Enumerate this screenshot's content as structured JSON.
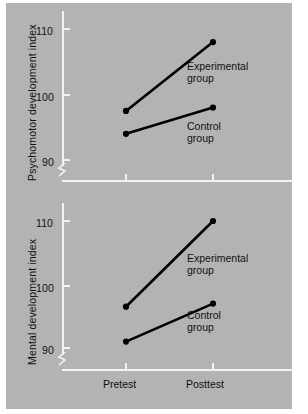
{
  "figure": {
    "background_color": "#b3b3b3",
    "axis_color": "#f2f2f2",
    "line_color": "#000000"
  },
  "chart_data": [
    {
      "type": "line",
      "title": "",
      "panel": "top",
      "xlabel": "",
      "ylabel": "Psychomotor development index",
      "categories": [
        "Pretest",
        "Posttest"
      ],
      "yticks": [
        90,
        100,
        110
      ],
      "ylim": [
        88,
        112
      ],
      "axis_break": true,
      "grid": false,
      "legend": "annotations-inline",
      "series": [
        {
          "name": "Experimental group",
          "values": [
            97.5,
            108.0
          ]
        },
        {
          "name": "Control group",
          "values": [
            94.0,
            98.0
          ]
        }
      ],
      "annotations": [
        {
          "text_line1": "Experimental",
          "text_line2": "group"
        },
        {
          "text_line1": "Control",
          "text_line2": "group"
        }
      ]
    },
    {
      "type": "line",
      "title": "",
      "panel": "bottom",
      "xlabel": "",
      "ylabel": "Mental development index",
      "categories": [
        "Pretest",
        "Posttest"
      ],
      "yticks": [
        90,
        100,
        110
      ],
      "ylim": [
        88,
        112
      ],
      "axis_break": true,
      "grid": false,
      "legend": "annotations-inline",
      "series": [
        {
          "name": "Experimental group",
          "values": [
            96.5,
            110.0
          ]
        },
        {
          "name": "Control group",
          "values": [
            91.0,
            97.0
          ]
        }
      ],
      "annotations": [
        {
          "text_line1": "Experimental",
          "text_line2": "group"
        },
        {
          "text_line1": "Control",
          "text_line2": "group"
        }
      ]
    }
  ],
  "top_panel": {
    "y_title": "Psychomotor development index",
    "ytick_labels": [
      "110",
      "100",
      "90"
    ],
    "exp_label_l1": "Experimental",
    "exp_label_l2": "group",
    "ctrl_label_l1": "Control",
    "ctrl_label_l2": "group"
  },
  "bottom_panel": {
    "y_title": "Mental development index",
    "ytick_labels": [
      "110",
      "100",
      "90"
    ],
    "exp_label_l1": "Experimental",
    "exp_label_l2": "group",
    "ctrl_label_l1": "Control",
    "ctrl_label_l2": "group"
  },
  "x_axis": {
    "tick_labels": [
      "Pretest",
      "Posttest"
    ]
  }
}
